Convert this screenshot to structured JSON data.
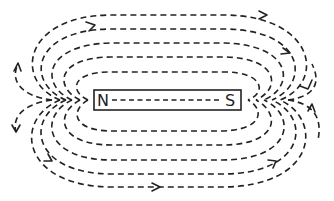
{
  "diagram": {
    "magnet": {
      "north_label": "N",
      "south_label": "S"
    },
    "field_lines": {
      "top_count": 5,
      "bottom_count": 5,
      "style": "dashed",
      "direction": "N to S (outside magnet)"
    },
    "colors": {
      "line": "#222222",
      "background": "#ffffff"
    }
  }
}
